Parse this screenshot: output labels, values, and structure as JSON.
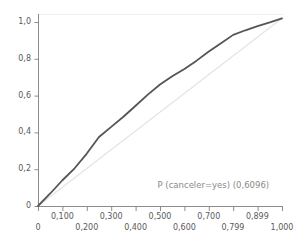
{
  "chart_data": {
    "type": "line",
    "title": "",
    "subtitle": "",
    "xlabel": "",
    "ylabel": "",
    "xlim": [
      0,
      1.0
    ],
    "ylim": [
      0,
      1.05
    ],
    "grid": false,
    "legend_position": "none",
    "annotations": [
      {
        "text": "P (canceler=yes) (0,6096)",
        "x": 0.49,
        "y": 0.11,
        "color": "#8a8a8a"
      }
    ],
    "x_tick_labels_upper": [
      "0,100",
      "0,300",
      "0,500",
      "0,700",
      "0,899"
    ],
    "x_tick_values_upper": [
      0.1,
      0.3,
      0.5,
      0.7,
      0.899
    ],
    "x_tick_labels_lower": [
      "0",
      "0,200",
      "0,400",
      "0,600",
      "0,799",
      "1,000"
    ],
    "x_tick_values_lower": [
      0.0,
      0.2,
      0.4,
      0.6,
      0.799,
      1.0
    ],
    "y_tick_labels": [
      "0",
      "0,2",
      "0,4",
      "0,6",
      "0,8",
      "1,0"
    ],
    "y_tick_values": [
      0.0,
      0.2,
      0.4,
      0.6,
      0.8,
      1.0
    ],
    "series": [
      {
        "name": "P (canceler=yes)",
        "auc": 0.6096,
        "color": "#555555",
        "width": 1.8,
        "x": [
          0.0,
          0.05,
          0.1,
          0.15,
          0.2,
          0.25,
          0.3,
          0.35,
          0.4,
          0.45,
          0.5,
          0.55,
          0.6,
          0.65,
          0.7,
          0.75,
          0.8,
          0.85,
          0.9,
          0.95,
          1.0
        ],
        "y": [
          0.0,
          0.068,
          0.14,
          0.205,
          0.285,
          0.375,
          0.43,
          0.485,
          0.545,
          0.605,
          0.66,
          0.705,
          0.745,
          0.79,
          0.84,
          0.885,
          0.93,
          0.955,
          0.978,
          0.998,
          1.02
        ]
      },
      {
        "name": "Baseline",
        "color": "#e4e4e4",
        "width": 1.2,
        "x": [
          0.0,
          1.0
        ],
        "y": [
          0.0,
          1.02
        ]
      }
    ],
    "axis_color": "#8c8c8c",
    "frame_top_color": "#f0f0f0",
    "background": "#ffffff"
  }
}
